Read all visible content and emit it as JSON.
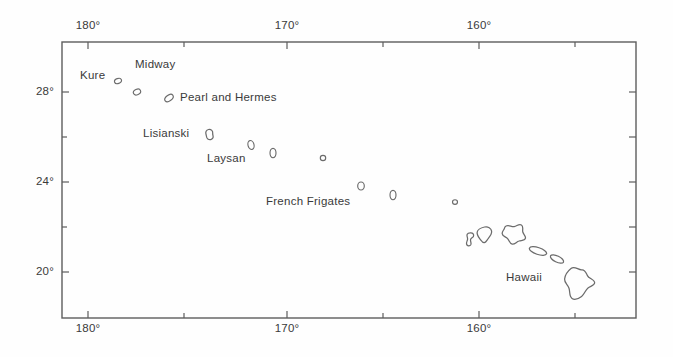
{
  "figure": {
    "kind": "map",
    "region": "Hawaiian Archipelago",
    "projection_note": "rectangular latitude-longitude frame",
    "frame": {
      "left_px": 62,
      "right_px": 636,
      "top_px": 42,
      "bottom_px": 318
    },
    "stroke_color": "#6b6b6b",
    "text_color": "#3a3a3a",
    "background_color": "#ffffff"
  },
  "axes": {
    "x": {
      "name": "longitude",
      "labeled_ticks_top": [
        {
          "label": "180°",
          "value": 180,
          "x_px": 88
        },
        {
          "label": "170°",
          "value": 170,
          "x_px": 287
        },
        {
          "label": "160°",
          "value": 160,
          "x_px": 479
        }
      ],
      "labeled_ticks_bottom": [
        {
          "label": "180°",
          "value": 180,
          "x_px": 88
        },
        {
          "label": "170°",
          "value": 170,
          "x_px": 287
        },
        {
          "label": "160°",
          "value": 160,
          "x_px": 479
        }
      ],
      "minor_ticks_px": [
        184,
        383,
        575
      ]
    },
    "y": {
      "name": "latitude",
      "labeled_ticks": [
        {
          "label": "28°",
          "value": 28,
          "y_px": 92
        },
        {
          "label": "24°",
          "value": 24,
          "y_px": 182
        },
        {
          "label": "20°",
          "value": 20,
          "y_px": 272
        }
      ],
      "minor_ticks_px": [
        137,
        227
      ],
      "right_side_ticks_px": [
        92,
        137,
        182,
        227,
        272
      ]
    }
  },
  "labels": [
    {
      "name": "kure",
      "text": "Kure",
      "x_px": 80,
      "y_px": 75
    },
    {
      "name": "midway",
      "text": "Midway",
      "x_px": 135,
      "y_px": 64
    },
    {
      "name": "pearl-and-hermes",
      "text": "Pearl and Hermes",
      "x_px": 180,
      "y_px": 91
    },
    {
      "name": "lisianski",
      "text": "Lisianski",
      "x_px": 143,
      "y_px": 127
    },
    {
      "name": "laysan",
      "text": "Laysan",
      "x_px": 207,
      "y_px": 152
    },
    {
      "name": "french-frigates",
      "text": "French Frigates",
      "x_px": 266,
      "y_px": 195
    },
    {
      "name": "hawaii",
      "text": "Hawaii",
      "x_px": 506,
      "y_px": 271
    }
  ],
  "islands": [
    {
      "name": "kure-atoll",
      "type": "tiny-ellipse",
      "cx": 118,
      "cy": 81,
      "rx": 3.4,
      "ry": 2.4,
      "rot": -20
    },
    {
      "name": "midway-atoll",
      "type": "tiny-ellipse",
      "cx": 137,
      "cy": 92,
      "rx": 3.6,
      "ry": 2.6,
      "rot": -25
    },
    {
      "name": "pearl-and-hermes-reef",
      "type": "tiny-ellipse",
      "cx": 169,
      "cy": 98,
      "rx": 4.6,
      "ry": 2.8,
      "rot": -35
    },
    {
      "name": "lisianski-island",
      "type": "blob",
      "cx": 210,
      "cy": 134,
      "scale": 1.0
    },
    {
      "name": "laysan-island",
      "type": "tiny-ellipse",
      "cx": 251,
      "cy": 145,
      "rx": 3.0,
      "ry": 4.4,
      "rot": -15
    },
    {
      "name": "maro-reef",
      "type": "tiny-ellipse",
      "cx": 273,
      "cy": 153,
      "rx": 3.0,
      "ry": 4.6,
      "rot": 0
    },
    {
      "name": "gardner-pinnacles",
      "type": "tiny-ellipse",
      "cx": 323,
      "cy": 158,
      "rx": 2.6,
      "ry": 2.6,
      "rot": 0
    },
    {
      "name": "french-frigate-shoals",
      "type": "tiny-ellipse",
      "cx": 361,
      "cy": 186,
      "rx": 3.2,
      "ry": 4.0,
      "rot": 0
    },
    {
      "name": "necker-island",
      "type": "tiny-ellipse",
      "cx": 393,
      "cy": 195,
      "rx": 3.0,
      "ry": 4.6,
      "rot": 0
    },
    {
      "name": "nihoa-island",
      "type": "tiny-ellipse",
      "cx": 455,
      "cy": 202,
      "rx": 2.4,
      "ry": 2.2,
      "rot": 0
    },
    {
      "name": "niihau",
      "type": "figure-eight",
      "cx": 471,
      "cy": 239
    },
    {
      "name": "kauai",
      "type": "heart-blob",
      "cx": 485,
      "cy": 234
    },
    {
      "name": "oahu",
      "type": "oahu-blob",
      "cx": 513,
      "cy": 236
    },
    {
      "name": "molokai",
      "type": "elongated",
      "cx": 538,
      "cy": 251,
      "rx": 8.5,
      "ry": 3.4,
      "rot": 18
    },
    {
      "name": "maui",
      "type": "elongated",
      "cx": 557,
      "cy": 258,
      "rx": 7.0,
      "ry": 3.0,
      "rot": 25
    },
    {
      "name": "hawaii-big-island",
      "type": "big-island",
      "cx": 578,
      "cy": 283
    }
  ],
  "notes": {
    "title": "",
    "caption": ""
  }
}
